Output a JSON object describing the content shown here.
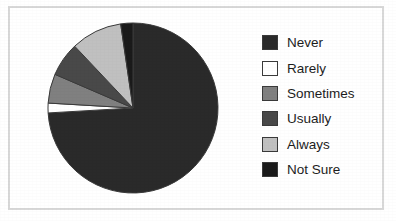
{
  "figure": {
    "background_color": "#ffffff",
    "frame_color": "#d8d8d8"
  },
  "legend": {
    "position": "right",
    "items": [
      {
        "label": "Never",
        "color": "#2a2a2a"
      },
      {
        "label": "Rarely",
        "color": "#ffffff"
      },
      {
        "label": "Sometimes",
        "color": "#808080"
      },
      {
        "label": "Usually",
        "color": "#494949"
      },
      {
        "label": "Always",
        "color": "#c0c0c0"
      },
      {
        "label": "Not Sure",
        "color": "#1a1a1a"
      }
    ]
  },
  "chart_data": {
    "type": "pie",
    "title": "",
    "labels": [
      "Never",
      "Rarely",
      "Sometimes",
      "Usually",
      "Always",
      "Not Sure"
    ],
    "values": [
      80.0,
      2.0,
      6.0,
      7.0,
      10.5,
      2.5
    ],
    "unit": "percent",
    "colors": [
      "#2a2a2a",
      "#ffffff",
      "#808080",
      "#494949",
      "#c0c0c0",
      "#1a1a1a"
    ],
    "start_angle_deg": 0,
    "direction": "clockwise",
    "slice_edge_color": "#3a3a3a",
    "center_x": 88,
    "center_y": 88,
    "radius": 85,
    "legend_position": "right",
    "grid": false
  }
}
